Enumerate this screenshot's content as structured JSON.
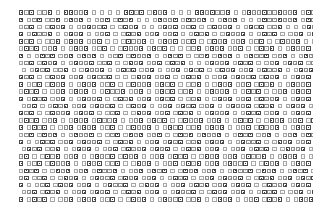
{
  "document": {
    "title": "Unrendered Text Page",
    "description": "A full page of body text in which every character renders as a missing-glyph box.",
    "background_color": "#ffffff",
    "glyph_colors": {
      "tofu_border": "#8a8a8a",
      "tofu_fill": "#c9c9c9",
      "tofu_light_border": "#a6a6a6",
      "tofu_light_fill": "#dcdcdc",
      "solid_border": "#4a4a4a",
      "solid_fill": "#3d3d3d"
    },
    "text_block": {
      "left_px": 19,
      "top_px": 12,
      "right_px": 312,
      "bottom_px": 203,
      "line_height_px": 7.2,
      "glyph_advance_px": 5.2,
      "glyph_size_px": 4.4,
      "line_count": 27,
      "alignment": "justified"
    },
    "glyph_legend": {
      "tofu": "missing-glyph-box",
      "tofu-light": "missing-glyph-box-light",
      "solid": "filled-square-glyph",
      "sp": "word-space"
    },
    "lines": [
      "SsTs.tTs.t.ssTTs.t.t.t.t.ssTs.tsTs.t.t.t.ssTsTTs.t.tsTTsTTsTTs.tsTTsTTs",
      "s.tTs.tTs.tsTs.t.tTs.tsTs.t.t.tsTTs.tsTTs.t.tsTs.t.t.tsTTsTTs.tsTs.tTs.t",
      "tTs.t.tsTs.t.tTsTTs.t.tsTs.t.t.tsTs.tTs.t.tsTTs.t.tsTs.tTs.t.t.tsTTs.tsT",
      "s.tsTTs.t.tsTs.t.tTs.t.tsTs.tTs.tTs.t.tsTs.t.tsTTs.t.tsTs.t.tTs.tsTTs.t.t",
      "sTs.t.tTs.tsTs.tTs.t.t.tsTTs.t.tsTs.tTs.t.tsTs.tTs.tTs.t.tsTTs.t.tsTs.t",
      "tsTs.tTs.t.tsTs.tTs.t.tsTTs.tsTs.t.t.tTs.tsTs.tTs.t.tsTs.t.tsTTs.tsTs.t",
      "s.t.tsTs.tTs.tsTs.t.tTs.tsTTs.t.tsTs.t.tTs.tsTs.t.tsTTs.tTs.t.tsTs.tTs.t",
      "tTs.tsTs.t.tsTTs.tTs.t.tsTs.tTs.tsTs.t.t.tsTTs.tsTs.t.tTs.tsTs.tTs.tsTs",
      ".t.tsTs.tTs.t.tsTTs.t.tsTs.tTs.t.tTs.tsTs.t.tsTs.tTs.tsTTs.t.tsTs.t.tTs",
      "sTs.t.tsTs.tTs.tsTTs.t.t.tsTs.tTs.t.tsTs.t.tTs.tsTTs.tsTs.t.tsTs.tTs.t.t",
      "s.tTs.tsTs.t.tsTs.tTs.t.tsTTs.tsTs.t.tTs.t.tsTs.tTs.tsTs.t.tsTTs.t.tsTs",
      "tsTs.t.tTs.tsTs.t.tsTTs.tTs.t.tsTs.tTs.t.tsTTs.t.tsTs.t.tTs.tsTs.tTs.tsT",
      "s.tsTs.tTs.t.tsTTs.t.tsTs.tTs.tsTs.t.tTs.t.tsTs.tTs.tsTTs.t.tsTs.t.tsTs",
      ".tTs.t.tsTs.tTs.tsTTs.t.tsTs.t.tTs.tsTs.tTs.t.tsTTs.tsTs.t.tsTs.tTs.t.tT",
      "sTs.t.tsTTs.tsTs.t.tTs.t.tsTs.tTs.tsTs.t.tsTTs.t.tsTs.tTs.t.tsTs.t.tTs.t",
      "tsTs.tTs.t.tsTs.tsTTs.t.tTs.tsTs.t.tsTTs.tTs.t.tsTs.t.tsTs.tTs.tsTTs.t",
      "s.tsTs.t.tTs.tsTs.tTs.t.tsTTs.t.tsTs.tTs.tsTs.t.tTs.tsTTs.t.tsTs.t.tsTs",
      "tTs.tsTs.t.tsTTs.t.tTs.tsTs.tTs.t.tsTs.tsTTs.t.tsTs.tTs.t.tTs.tsTs.t.tsT",
      "s.t.tsTs.tTs.tsTTs.t.tsTs.t.tTs.tsTs.tTs.tsTs.t.tsTTs.t.tsTs.tTs.t.tsTs",
      ".tsTs.tTs.t.tsTs.t.tTs.tsTTs.tsTs.t.tsTs.tTs.t.tTs.tsTs.t.tsTTs.tTs.t.ts",
      "Ts.t.tsTs.tTs.t.tsTTs.tsTs.t.tTs.tsTs.t.tsTs.tTs.tsTTs.t.tsTs.t.tTs.tsTs",
      "s.tTs.tsTTs.t.tsTs.tTs.t.tsTs.t.tTs.tsTs.tTs.tsTTs.t.tsTs.t.tsTs.tTs.t.t",
      "tsTs.t.tsTs.tTs.tsTTs.t.tTs.tsTs.t.tsTs.tTs.t.tsTTs.tsTs.t.tsTs.t.tTs.ts",
      "Ts.tTs.t.tsTs.t.tsTTs.tsTs.tTs.t.tsTs.t.tTs.tsTTs.t.tsTs.tTs.tsTs.t.tsTs",
      "s.t.tTs.tsTs.tTs.t.tsTTs.t.tsTs.t.tTs.tsTs.tTs.tsTs.t.tsTTs.tsTs.t.tsTs",
      ".tTs.tsTs.t.tTs.tsTs.t.tsTs.tTs.t.tsTTs.t.tsTs.tTs.t.tsTs.t.tTs.tsTs.tsT",
      "s.tsTs.t.tTs.tsTs.tTs.t.tsTs.t.tsTTs.tTs.t.tsTs.t.tTs.tsTs.t.tsTs.tTs.tt"
    ]
  }
}
